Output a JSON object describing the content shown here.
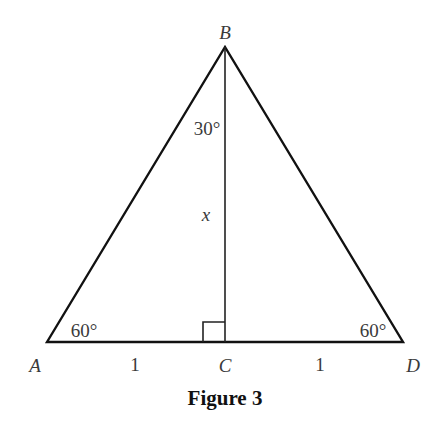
{
  "figure": {
    "caption": "Figure 3",
    "vertices": {
      "A": {
        "label": "A",
        "x": 47,
        "y": 342
      },
      "B": {
        "label": "B",
        "x": 225,
        "y": 47
      },
      "C": {
        "label": "C",
        "x": 225,
        "y": 342
      },
      "D": {
        "label": "D",
        "x": 403,
        "y": 342
      }
    },
    "angles": {
      "B_half": "30°",
      "A": "60°",
      "D": "60°"
    },
    "segments": {
      "BC": "x",
      "AC": "1",
      "CD": "1"
    },
    "right_angle_at": "C"
  }
}
